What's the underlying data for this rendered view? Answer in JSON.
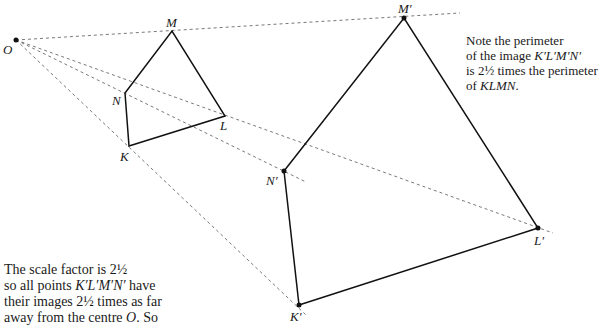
{
  "diagram": {
    "type": "enlargement",
    "centre": {
      "label": "O",
      "x": 16,
      "y": 40
    },
    "object": [
      {
        "label": "K",
        "x": 129,
        "y": 146
      },
      {
        "label": "L",
        "x": 225,
        "y": 116
      },
      {
        "label": "M",
        "x": 172,
        "y": 31
      },
      {
        "label": "N",
        "x": 125,
        "y": 93
      }
    ],
    "image": [
      {
        "label": "K'",
        "x": 299,
        "y": 305
      },
      {
        "label": "L'",
        "x": 538,
        "y": 228
      },
      {
        "label": "M'",
        "x": 404,
        "y": 18
      },
      {
        "label": "N'",
        "x": 284,
        "y": 171
      }
    ],
    "scale_factor": "2½"
  },
  "labels": {
    "O": "O",
    "M": "M",
    "N": "N",
    "L": "L",
    "K": "K",
    "Mp": "M′",
    "Np": "N′",
    "Lp": "L′",
    "Kp": "K′"
  },
  "note_right": {
    "line1": "Note the perimeter",
    "line2a": "of the image ",
    "line2b": "K′L′M′N′",
    "line3": "is 2½ times the perimeter",
    "line4a": "of ",
    "line4b": "KLMN",
    "line4c": "."
  },
  "note_left": {
    "line1": "The scale factor is 2½",
    "line2a": "so all points ",
    "line2b": "K′L′M′N′",
    "line2c": " have",
    "line3": "their images 2½ times as far",
    "line4a": "away from the centre ",
    "line4b": "O",
    "line4c": ". So"
  }
}
